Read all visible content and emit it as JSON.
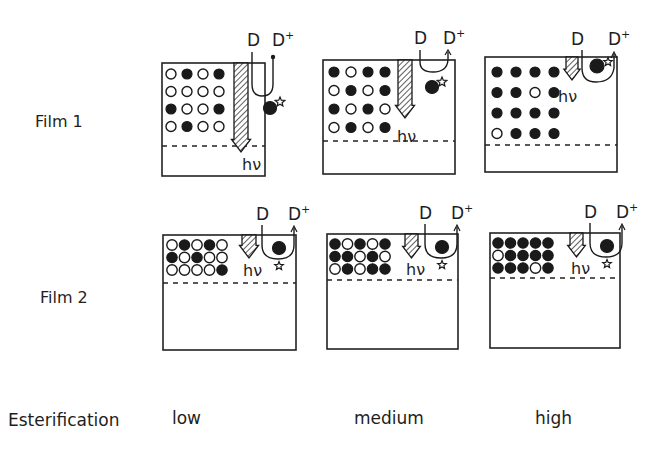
{
  "figure": {
    "rows": [
      {
        "label": "Film 1"
      },
      {
        "label": "Film 2"
      }
    ],
    "row_title": "Esterification",
    "columns": [
      {
        "label": "low"
      },
      {
        "label": "medium"
      },
      {
        "label": "high"
      }
    ],
    "symbols": {
      "dye": "D",
      "dye_cation": "D",
      "dye_cation_superscript": "+",
      "photon": "hν",
      "excited_marker": "star-icon"
    },
    "legend_semantics": {
      "open_circle": "unesterified site",
      "filled_circle": "esterified site"
    },
    "panels": {
      "film1": [
        {
          "level": "low",
          "grid": [
            [
              0,
              1,
              0,
              1
            ],
            [
              0,
              0,
              0,
              0
            ],
            [
              1,
              0,
              0,
              1
            ],
            [
              0,
              1,
              0,
              0
            ]
          ]
        },
        {
          "level": "medium",
          "grid": [
            [
              1,
              0,
              1,
              1
            ],
            [
              0,
              1,
              0,
              1
            ],
            [
              1,
              0,
              1,
              0
            ],
            [
              0,
              1,
              0,
              1
            ]
          ]
        },
        {
          "level": "high",
          "grid": [
            [
              1,
              1,
              1,
              1
            ],
            [
              1,
              1,
              0,
              1
            ],
            [
              1,
              1,
              1,
              1
            ],
            [
              0,
              1,
              1,
              1
            ]
          ]
        }
      ],
      "film2": [
        {
          "level": "low",
          "grid": [
            [
              0,
              1,
              0,
              1,
              0
            ],
            [
              1,
              0,
              1,
              0,
              0
            ],
            [
              0,
              0,
              0,
              0,
              1
            ]
          ]
        },
        {
          "level": "medium",
          "grid": [
            [
              1,
              0,
              1,
              0,
              1
            ],
            [
              1,
              1,
              0,
              1,
              0
            ],
            [
              0,
              1,
              0,
              1,
              1
            ]
          ]
        },
        {
          "level": "high",
          "grid": [
            [
              1,
              1,
              1,
              1,
              1
            ],
            [
              0,
              1,
              1,
              1,
              1
            ],
            [
              1,
              1,
              1,
              0,
              1
            ]
          ]
        }
      ]
    },
    "colors": {
      "ink": "#1a1a1a",
      "background": "#ffffff"
    }
  }
}
